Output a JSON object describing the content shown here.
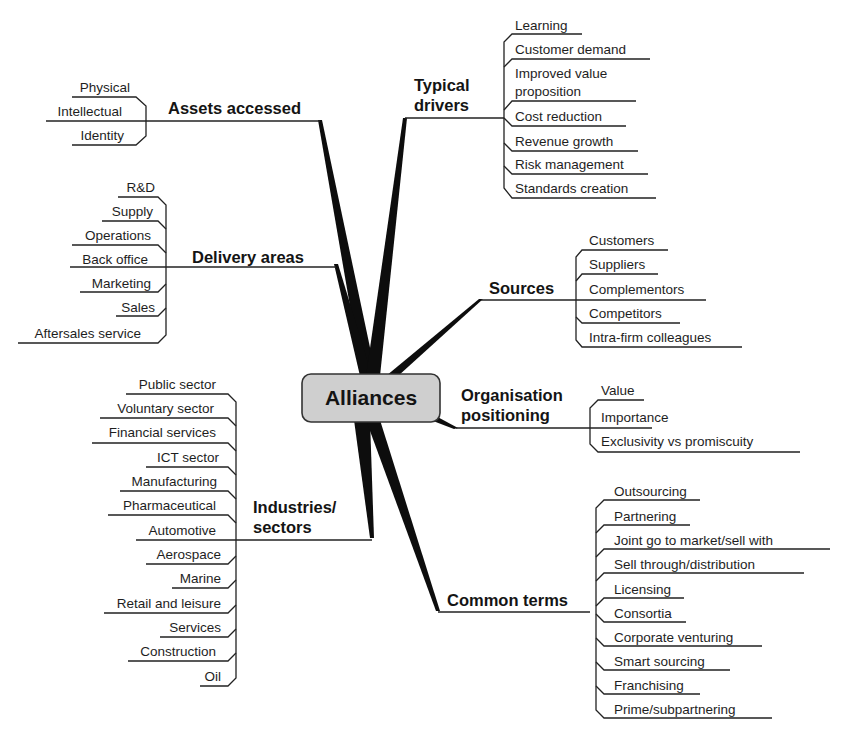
{
  "title": "Alliances",
  "colors": {
    "center_fill": "#cfcfcf",
    "center_border": "#333333",
    "line": "#222222",
    "spoke": "#0d0d0d"
  },
  "branches": [
    {
      "id": "assets-accessed",
      "label": [
        "Assets accessed"
      ],
      "side": "left",
      "items": [
        "Physical",
        "Intellectual",
        "Identity"
      ]
    },
    {
      "id": "delivery-areas",
      "label": [
        "Delivery areas"
      ],
      "side": "left",
      "items": [
        "R&D",
        "Supply",
        "Operations",
        "Back office",
        "Marketing",
        "Sales",
        "Aftersales service"
      ]
    },
    {
      "id": "industries-sectors",
      "label": [
        "Industries/",
        "sectors"
      ],
      "side": "left",
      "items": [
        "Public sector",
        "Voluntary sector",
        "Financial services",
        "ICT sector",
        "Manufacturing",
        "Pharmaceutical",
        "Automotive",
        "Aerospace",
        "Marine",
        "Retail and leisure",
        "Services",
        "Construction",
        "Oil"
      ]
    },
    {
      "id": "typical-drivers",
      "label": [
        "Typical",
        "drivers"
      ],
      "side": "right",
      "items": [
        "Learning",
        "Customer demand",
        "Improved value proposition",
        "Cost reduction",
        "Revenue growth",
        "Risk management",
        "Standards creation"
      ]
    },
    {
      "id": "sources",
      "label": [
        "Sources"
      ],
      "side": "right",
      "items": [
        "Customers",
        "Suppliers",
        "Complementors",
        "Competitors",
        "Intra-firm colleagues"
      ]
    },
    {
      "id": "organisation-positioning",
      "label": [
        "Organisation",
        "positioning"
      ],
      "side": "right",
      "items": [
        "Value",
        "Importance",
        "Exclusivity vs promiscuity"
      ]
    },
    {
      "id": "common-terms",
      "label": [
        "Common terms"
      ],
      "side": "right",
      "items": [
        "Outsourcing",
        "Partnering",
        "Joint go to market/sell with",
        "Sell through/distribution",
        "Licensing",
        "Consortia",
        "Corporate venturing",
        "Smart sourcing",
        "Franchising",
        "Prime/subpartnering"
      ]
    }
  ]
}
